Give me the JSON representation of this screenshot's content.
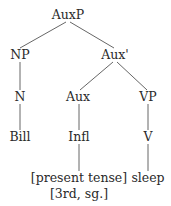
{
  "diagram": {
    "type": "syntax-tree",
    "nodes": [
      {
        "id": "auxp",
        "label": "AuxP",
        "x": 68,
        "y": 15
      },
      {
        "id": "np",
        "label": "NP",
        "x": 20,
        "y": 55
      },
      {
        "id": "auxbar",
        "label": "Aux'",
        "x": 115,
        "y": 55
      },
      {
        "id": "n",
        "label": "N",
        "x": 20,
        "y": 97
      },
      {
        "id": "aux",
        "label": "Aux",
        "x": 78,
        "y": 97
      },
      {
        "id": "vp",
        "label": "VP",
        "x": 148,
        "y": 97
      },
      {
        "id": "bill",
        "label": "Bill",
        "x": 20,
        "y": 137
      },
      {
        "id": "infl",
        "label": "Infl",
        "x": 79,
        "y": 137
      },
      {
        "id": "v",
        "label": "V",
        "x": 148,
        "y": 137
      },
      {
        "id": "present_tense",
        "label": "[present tense]",
        "x": 79,
        "y": 178
      },
      {
        "id": "third_sg",
        "label": "[3rd, sg.]",
        "x": 79,
        "y": 194
      },
      {
        "id": "sleep",
        "label": "sleep",
        "x": 148,
        "y": 178
      }
    ],
    "edges": [
      {
        "from": "auxp",
        "to": "np",
        "x1": 66,
        "y1": 22,
        "x2": 20,
        "y2": 48
      },
      {
        "from": "auxp",
        "to": "auxbar",
        "x1": 70,
        "y1": 22,
        "x2": 114,
        "y2": 48
      },
      {
        "from": "np",
        "to": "n",
        "x1": 20,
        "y1": 62,
        "x2": 20,
        "y2": 90
      },
      {
        "from": "auxbar",
        "to": "aux",
        "x1": 113,
        "y1": 62,
        "x2": 80,
        "y2": 90
      },
      {
        "from": "auxbar",
        "to": "vp",
        "x1": 117,
        "y1": 62,
        "x2": 147,
        "y2": 90
      },
      {
        "from": "n",
        "to": "bill",
        "x1": 20,
        "y1": 104,
        "x2": 20,
        "y2": 130
      },
      {
        "from": "aux",
        "to": "infl",
        "x1": 79,
        "y1": 104,
        "x2": 79,
        "y2": 130
      },
      {
        "from": "vp",
        "to": "v",
        "x1": 148,
        "y1": 104,
        "x2": 148,
        "y2": 130
      },
      {
        "from": "infl",
        "to": "features",
        "x1": 79,
        "y1": 144,
        "x2": 79,
        "y2": 171
      },
      {
        "from": "v",
        "to": "sleep",
        "x1": 148,
        "y1": 144,
        "x2": 148,
        "y2": 171
      }
    ]
  }
}
